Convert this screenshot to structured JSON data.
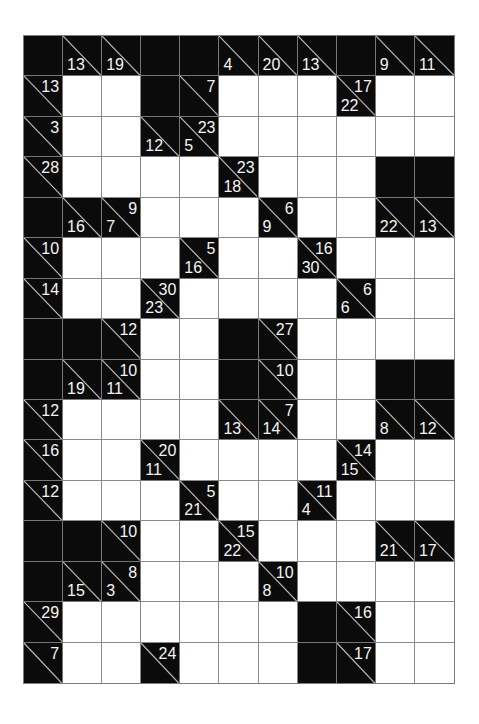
{
  "puzzle": {
    "type": "kakuro",
    "cols": 11,
    "rows": 16,
    "colors": {
      "black": "#0b0b0b",
      "white": "#ffffff",
      "grid_line": "#8a8a8a",
      "clue_text": "#f4f4f4"
    },
    "grid": [
      [
        "B",
        {
          "d": 13
        },
        {
          "d": 19
        },
        "B",
        "B",
        {
          "d": 4
        },
        {
          "d": 20
        },
        {
          "d": 13
        },
        "B",
        {
          "d": 9
        },
        {
          "d": 11
        }
      ],
      [
        {
          "r": 13
        },
        "W",
        "W",
        "B",
        {
          "r": 7
        },
        "W",
        "W",
        "W",
        {
          "d": 22,
          "r": 17
        },
        "W",
        "W"
      ],
      [
        {
          "r": 3
        },
        "W",
        "W",
        {
          "d": 12
        },
        {
          "d": 5,
          "r": 23
        },
        "W",
        "W",
        "W",
        "W",
        "W",
        "W"
      ],
      [
        {
          "r": 28
        },
        "W",
        "W",
        "W",
        "W",
        {
          "d": 18,
          "r": 23
        },
        "W",
        "W",
        "W",
        "B",
        "B"
      ],
      [
        "B",
        {
          "d": 16
        },
        {
          "d": 7,
          "r": 9
        },
        "W",
        "W",
        "W",
        {
          "d": 9,
          "r": 6
        },
        "W",
        "W",
        {
          "d": 22
        },
        {
          "d": 13
        }
      ],
      [
        {
          "r": 10
        },
        "W",
        "W",
        "W",
        {
          "d": 16,
          "r": 5
        },
        "W",
        "W",
        {
          "d": 30,
          "r": 16
        },
        "W",
        "W",
        "W"
      ],
      [
        {
          "r": 14
        },
        "W",
        "W",
        {
          "d": 23,
          "r": 30
        },
        "W",
        "W",
        "W",
        "W",
        {
          "d": 6,
          "r": 6
        },
        "W",
        "W"
      ],
      [
        "B",
        "B",
        {
          "r": 12
        },
        "W",
        "W",
        "B",
        {
          "r": 27
        },
        "W",
        "W",
        "W",
        "W"
      ],
      [
        "B",
        {
          "d": 19
        },
        {
          "d": 11,
          "r": 10
        },
        "W",
        "W",
        "B",
        {
          "r": 10
        },
        "W",
        "W",
        "B",
        "B"
      ],
      [
        {
          "r": 12
        },
        "W",
        "W",
        "W",
        "W",
        {
          "d": 13
        },
        {
          "d": 14,
          "r": 7
        },
        "W",
        "W",
        {
          "d": 8
        },
        {
          "d": 12
        }
      ],
      [
        {
          "r": 16
        },
        "W",
        "W",
        {
          "d": 11,
          "r": 20
        },
        "W",
        "W",
        "W",
        "W",
        {
          "d": 15,
          "r": 14
        },
        "W",
        "W"
      ],
      [
        {
          "r": 12
        },
        "W",
        "W",
        "W",
        {
          "d": 21,
          "r": 5
        },
        "W",
        "W",
        {
          "d": 4,
          "r": 11
        },
        "W",
        "W",
        "W"
      ],
      [
        "B",
        "B",
        {
          "r": 10
        },
        "W",
        "W",
        {
          "d": 22,
          "r": 15
        },
        "W",
        "W",
        "W",
        {
          "d": 21
        },
        {
          "d": 17
        }
      ],
      [
        "B",
        {
          "d": 15
        },
        {
          "d": 3,
          "r": 8
        },
        "W",
        "W",
        "W",
        {
          "d": 8,
          "r": 10
        },
        "W",
        "W",
        "W",
        "W"
      ],
      [
        {
          "r": 29
        },
        "W",
        "W",
        "W",
        "W",
        "W",
        "W",
        "B",
        {
          "r": 16
        },
        "W",
        "W"
      ],
      [
        {
          "r": 7
        },
        "W",
        "W",
        {
          "r": 24
        },
        "W",
        "W",
        "W",
        "B",
        {
          "r": 17
        },
        "W",
        "W"
      ]
    ]
  }
}
